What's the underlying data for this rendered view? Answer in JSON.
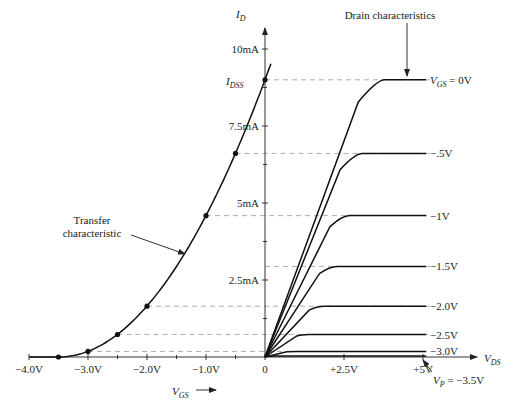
{
  "chart_data": {
    "type": "line",
    "title": "",
    "params": {
      "IDSS_mA": 9,
      "VP_V": -3.5
    },
    "left_panel": {
      "name": "Transfer characteristic",
      "xlabel": "V_GS",
      "xlim": [
        -4.0,
        0
      ],
      "x_ticks": [
        {
          "value": -4.0,
          "label": "−4.0V"
        },
        {
          "value": -3.0,
          "label": "−3.0V"
        },
        {
          "value": -2.0,
          "label": "−2.0V"
        },
        {
          "value": -1.0,
          "label": "−1.0V"
        },
        {
          "value": 0,
          "label": "0"
        }
      ],
      "points": [
        {
          "vgs": 0,
          "id": 9.0
        },
        {
          "vgs": -0.5,
          "id": 6.61
        },
        {
          "vgs": -1.0,
          "id": 4.59
        },
        {
          "vgs": -2.0,
          "id": 1.65
        },
        {
          "vgs": -2.5,
          "id": 0.73
        },
        {
          "vgs": -3.0,
          "id": 0.18
        },
        {
          "vgs": -3.5,
          "id": 0.0
        }
      ]
    },
    "right_panel": {
      "name": "Drain characteristics",
      "xlabel": "V_DS",
      "xlim": [
        0,
        6.5
      ],
      "x_ticks": [
        {
          "value": 2.5,
          "label": "+2.5V"
        },
        {
          "value": 5,
          "label": "+5V"
        }
      ],
      "vds_end": 5.1,
      "series": [
        {
          "vgs": 0,
          "label": "V_GS = 0V",
          "id_sat": 9.0,
          "knee_vds": 3.6
        },
        {
          "vgs": -0.5,
          "label": "−.5V",
          "id_sat": 6.61,
          "knee_vds": 2.9
        },
        {
          "vgs": -1.0,
          "label": "−1V",
          "id_sat": 4.59,
          "knee_vds": 2.5
        },
        {
          "vgs": -1.5,
          "label": "−1.5V",
          "id_sat": 2.94,
          "knee_vds": 2.1
        },
        {
          "vgs": -2.0,
          "label": "−2.0V",
          "id_sat": 1.65,
          "knee_vds": 1.7
        },
        {
          "vgs": -2.5,
          "label": "−2.5V",
          "id_sat": 0.73,
          "knee_vds": 1.2
        },
        {
          "vgs": -3.0,
          "label": "−3.0V",
          "id_sat": 0.18,
          "knee_vds": 0.8
        },
        {
          "vgs": -3.5,
          "label": "V_P = −3.5V",
          "id_sat": 0.0,
          "knee_vds": 0.0
        }
      ]
    },
    "ylabel": "I_D",
    "ylim": [
      0,
      11
    ],
    "y_ticks": [
      {
        "value": 2.5,
        "label": "2.5mA"
      },
      {
        "value": 5,
        "label": "5mA"
      },
      {
        "value": 7.5,
        "label": "7.5mA"
      },
      {
        "value": 10,
        "label": "10mA"
      }
    ],
    "idss_label": "I_DSS",
    "annotations": {
      "transfer_line1": "Transfer",
      "transfer_line2": "characteristic",
      "drain": "Drain characteristics"
    }
  }
}
